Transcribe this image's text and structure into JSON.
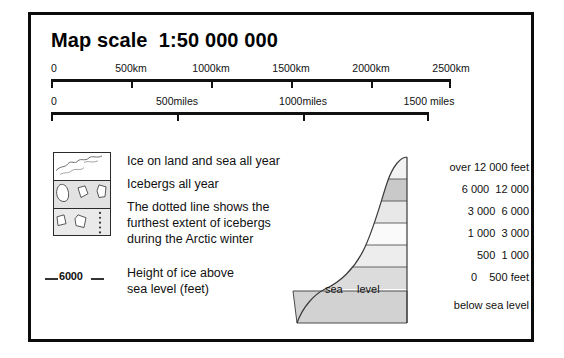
{
  "title": "Map scale  1:50 000 000",
  "scales": {
    "km": {
      "unit": "km",
      "ticks": [
        {
          "label": "0",
          "value": 0
        },
        {
          "label": "500km",
          "value": 500
        },
        {
          "label": "1000km",
          "value": 1000
        },
        {
          "label": "1500km",
          "value": 1500
        },
        {
          "label": "2000km",
          "value": 2000
        },
        {
          "label": "2500km",
          "value": 2500
        }
      ]
    },
    "miles": {
      "unit": "miles",
      "ticks": [
        {
          "label": "0",
          "value": 0
        },
        {
          "label": "500miles",
          "value": 500
        },
        {
          "label": "1000miles",
          "value": 1000
        },
        {
          "label": "1500 miles",
          "value": 1500
        }
      ]
    }
  },
  "key": {
    "ice_on_land": "Ice on land and sea all year",
    "icebergs": "Icebergs all year",
    "dotted_line_1": "The dotted line shows the",
    "dotted_line_2": "furthest extent of icebergs",
    "dotted_line_3": "during the Arctic winter",
    "height_1": "Height of ice above",
    "height_2": "sea level (feet)",
    "contour_value": "6000"
  },
  "profile": {
    "sea_label_left": "sea",
    "sea_label_right": "level",
    "bands": [
      {
        "label": "over 12 000 feet",
        "fill": "#f2f2f2"
      },
      {
        "label": "6 000  12 000",
        "fill": "#c9c9c9"
      },
      {
        "label": "3 000  6 000",
        "fill": "#e8e8e8"
      },
      {
        "label": "1 000  3 000",
        "fill": "#fafafa"
      },
      {
        "label": "500  1 000",
        "fill": "#ededed"
      },
      {
        "label": "0    500 feet",
        "fill": "#dcdcdc"
      },
      {
        "label": "below sea level",
        "fill": "#d2d2d2"
      }
    ]
  },
  "colors": {
    "ink": "#111111",
    "frame": "#0b0b0b",
    "paper": "#ffffff"
  }
}
